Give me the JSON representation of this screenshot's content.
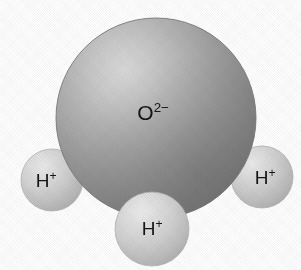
{
  "figure": {
    "kind": "space-filling-molecular-model",
    "molecule_name": "water",
    "background_color": "#ffffff",
    "width": 301,
    "height": 270
  },
  "atoms": {
    "oxygen": {
      "name": "oxygen-sphere",
      "element_symbol": "O",
      "charge_text": "2−",
      "label_full": "O2−",
      "center_x": 156,
      "center_y": 118,
      "radius": 100,
      "fill_base_color": "#9a9a9a",
      "highlight_color": "#d5d5d5",
      "shadow_color": "#6f6f6f",
      "edge_color": "#7d7d7d",
      "label_x": 153,
      "label_y": 112
    },
    "hydrogen_left": {
      "name": "hydrogen-sphere-left",
      "element_symbol": "H",
      "charge_text": "+",
      "label_full": "H+",
      "center_x": 52,
      "center_y": 180,
      "radius": 31,
      "fill_base_color": "#c6c6c6",
      "highlight_color": "#e8e8e8",
      "shadow_color": "#a5a5a5",
      "edge_color": "#b0b0b0",
      "label_x": 46,
      "label_y": 180
    },
    "hydrogen_right": {
      "name": "hydrogen-sphere-right",
      "element_symbol": "H",
      "charge_text": "+",
      "label_full": "H+",
      "center_x": 262,
      "center_y": 177,
      "radius": 31,
      "fill_base_color": "#c6c6c6",
      "highlight_color": "#e8e8e8",
      "shadow_color": "#a5a5a5",
      "edge_color": "#b0b0b0",
      "label_x": 265,
      "label_y": 177
    },
    "hydrogen_bottom": {
      "name": "hydrogen-sphere-bottom",
      "element_symbol": "H",
      "charge_text": "+",
      "label_full": "H+",
      "center_x": 152,
      "center_y": 229,
      "radius": 37,
      "fill_base_color": "#c6c6c6",
      "highlight_color": "#e8e8e8",
      "shadow_color": "#a5a5a5",
      "edge_color": "#b0b0b0",
      "label_x": 152,
      "label_y": 228
    }
  }
}
